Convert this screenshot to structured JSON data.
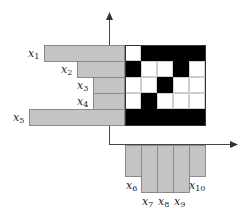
{
  "diagram": {
    "grid": {
      "rows": 5,
      "cols": 5,
      "cells": [
        [
          0,
          1,
          1,
          1,
          1
        ],
        [
          1,
          0,
          0,
          1,
          0
        ],
        [
          0,
          0,
          1,
          0,
          0
        ],
        [
          0,
          1,
          0,
          0,
          0
        ],
        [
          1,
          1,
          1,
          1,
          1
        ]
      ],
      "colors": {
        "filled": "#000000",
        "empty": "#ffffff"
      }
    },
    "row_projections": [
      {
        "label": "x",
        "sub": "1",
        "length": 65
      },
      {
        "label": "x",
        "sub": "2",
        "length": 32
      },
      {
        "label": "x",
        "sub": "3",
        "length": 16
      },
      {
        "label": "x",
        "sub": "4",
        "length": 16
      },
      {
        "label": "x",
        "sub": "5",
        "length": 80
      }
    ],
    "column_projections": [
      {
        "label": "x",
        "sub": "6",
        "length": 32
      },
      {
        "label": "x",
        "sub": "7",
        "length": 48
      },
      {
        "label": "x",
        "sub": "8",
        "length": 48
      },
      {
        "label": "x",
        "sub": "9",
        "length": 48
      },
      {
        "label": "x",
        "sub": "10",
        "length": 32
      }
    ],
    "bar_color": "#c4c4c4"
  }
}
